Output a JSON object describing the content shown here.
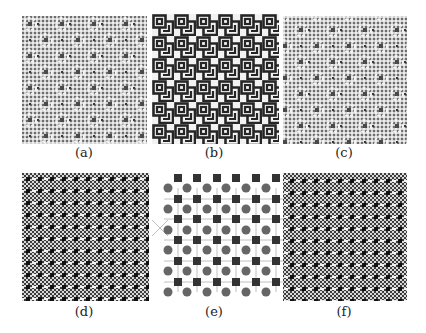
{
  "figure": {
    "panels": [
      {
        "id": "a",
        "label": "(a)",
        "type": "dot-grid-rosette-pattern"
      },
      {
        "id": "b",
        "label": "(b)",
        "type": "maze-key-pattern"
      },
      {
        "id": "c",
        "label": "(c)",
        "type": "dot-grid-rosette-pattern"
      },
      {
        "id": "d",
        "label": "(d)",
        "type": "checkerboard-interference-pattern"
      },
      {
        "id": "e",
        "label": "(e)",
        "type": "lattice-squares-circles"
      },
      {
        "id": "f",
        "label": "(f)",
        "type": "checkerboard-interference-pattern"
      }
    ],
    "colors": {
      "dark": "#2a2a2a",
      "gray": "#6a6a6a",
      "light": "#bdbdbd",
      "line": "#a8a8a8",
      "background": "#ffffff"
    }
  }
}
